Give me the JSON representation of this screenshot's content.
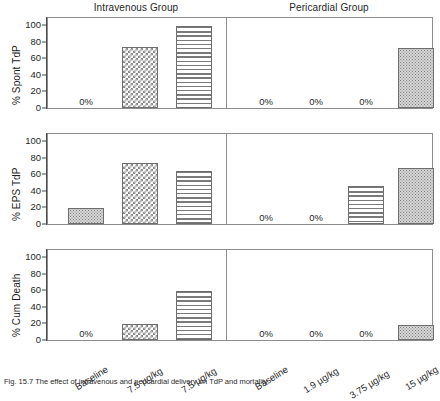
{
  "figure": {
    "caption": "Fig. 15.7 The effect of intravenous and pericardial delivery on TdP and mortality",
    "groups": [
      {
        "key": "intravenous",
        "title": "Intravenous Group"
      },
      {
        "key": "pericardial",
        "title": "Pericardial Group"
      }
    ]
  },
  "chart_data": {
    "type": "bar",
    "title": "",
    "xlabel": "",
    "ylim": [
      0,
      100
    ],
    "yticks": [
      0,
      20,
      40,
      60,
      80,
      100
    ],
    "grid": false,
    "legend": "none",
    "panels": [
      {
        "ylabel": "% Spont TdP",
        "groups": [
          {
            "name": "Intravenous Group",
            "categories": [
              "Baseline",
              "7.5 µg/kg",
              "7.5 µg/kg"
            ],
            "values": [
              0,
              73,
              99
            ],
            "patterns": [
              "none",
              "checker",
              "hlines"
            ],
            "labels": [
              "0%",
              "",
              ""
            ]
          },
          {
            "name": "Pericardial Group",
            "categories": [
              "Baseline",
              "1.9 µg/kg",
              "3.75 µg/kg",
              "15 µg/kg"
            ],
            "values": [
              0,
              0,
              0,
              72
            ],
            "patterns": [
              "none",
              "none",
              "none",
              "stipple"
            ],
            "labels": [
              "0%",
              "0%",
              "0%",
              ""
            ]
          }
        ]
      },
      {
        "ylabel": "% EPS TdP",
        "groups": [
          {
            "name": "Intravenous Group",
            "categories": [
              "Baseline",
              "7.5 µg/kg",
              "7.5 µg/kg"
            ],
            "values": [
              19,
              74,
              64
            ],
            "patterns": [
              "stipple",
              "checker",
              "hlines"
            ],
            "labels": [
              "",
              "",
              ""
            ]
          },
          {
            "name": "Pericardial Group",
            "categories": [
              "Baseline",
              "1.9 µg/kg",
              "3.75 µg/kg",
              "15 µg/kg"
            ],
            "values": [
              0,
              0,
              46,
              68
            ],
            "patterns": [
              "none",
              "none",
              "hlines",
              "stipple"
            ],
            "labels": [
              "0%",
              "0%",
              "",
              ""
            ]
          }
        ]
      },
      {
        "ylabel": "% Cum Death",
        "groups": [
          {
            "name": "Intravenous Group",
            "categories": [
              "Baseline",
              "7.5 µg/kg",
              "7.5 µg/kg"
            ],
            "values": [
              0,
              19,
              59
            ],
            "patterns": [
              "none",
              "checker",
              "hlines"
            ],
            "labels": [
              "0%",
              "",
              ""
            ]
          },
          {
            "name": "Pericardial Group",
            "categories": [
              "Baseline",
              "1.9 µg/kg",
              "3.75 µg/kg",
              "15 µg/kg"
            ],
            "values": [
              0,
              0,
              0,
              18
            ],
            "patterns": [
              "none",
              "none",
              "none",
              "stipple"
            ],
            "labels": [
              "0%",
              "0%",
              "0%",
              ""
            ]
          }
        ]
      }
    ],
    "xtick_labels": [
      "Baseline",
      "7.5 µg/kg",
      "7.5 µg/kg",
      "Baseline",
      "1.9 µg/kg",
      "3.75 µg/kg",
      "15 µg/kg"
    ]
  },
  "colors": {
    "axis": "#8d8d8d",
    "text": "#1f1f1f",
    "bar_outline": "#6e6e6e",
    "pattern_gray": "#8c8c8c",
    "background": "#ffffff"
  }
}
